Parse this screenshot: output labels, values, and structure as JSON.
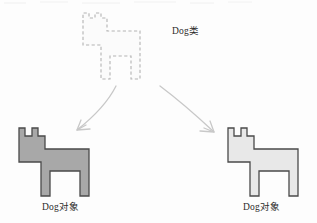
{
  "diagram": {
    "title_class_label": "Dog类",
    "object_left_label": "Dog对象",
    "object_right_label": "Dog对象",
    "colors": {
      "background": "#fdfdfd",
      "outline_dark": "#4a4a4a",
      "class_shape_fill": "#fbfbfb",
      "class_shape_stroke": "#b9b9b9",
      "object_left_fill": "#a8a8a8",
      "object_right_fill": "#e8e8e8",
      "arrow_stroke": "#c6c6c6",
      "text": "#2b2b2b"
    },
    "shapes": {
      "class_dog": {
        "name": "dashed-dog-outline",
        "style": "dashed",
        "points": "83,18 83,13 89,13 89,18 95,18 95,13 101,13 101,18 107,18 107,31 140,31 140,79 131,79 131,56 110,56 110,79 101,79 101,45 83,45"
      },
      "object_dog_left": {
        "name": "solid-dog-left",
        "style": "solid",
        "points": "19,136 19,128 25,128 25,136 32,136 32,128 38,128 38,136 45,136 45,149 89,149 89,196 80,196 80,171 50,171 50,196 41,196 41,162 19,162"
      },
      "object_dog_right": {
        "name": "solid-dog-right",
        "style": "solid",
        "points": "228,136 228,128 234,128 234,136 241,136 241,128 247,128 247,136 254,136 254,149 298,149 298,196 289,196 289,171 259,171 259,196 250,196 250,162 228,162"
      }
    },
    "arrows": [
      {
        "name": "arrow-to-left-object",
        "direction": "down-left",
        "path": "M 116 86 C 108 100, 95 115, 76 130"
      },
      {
        "name": "arrow-to-right-object",
        "direction": "down-right",
        "path": "M 160 86 C 180 101, 198 117, 214 132"
      }
    ]
  }
}
